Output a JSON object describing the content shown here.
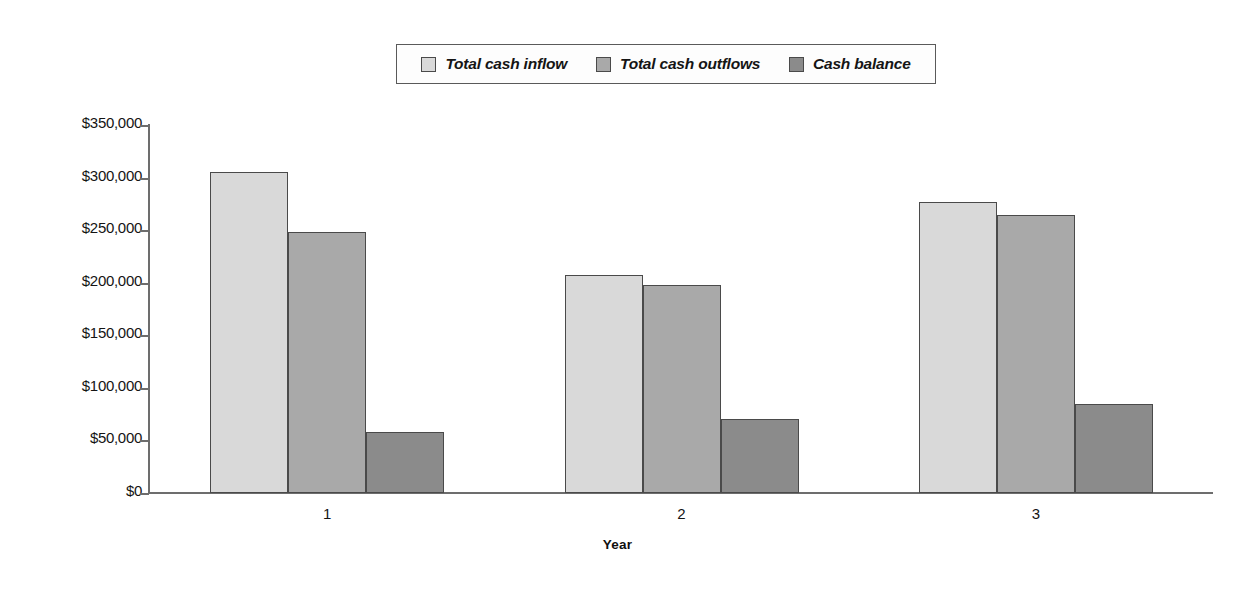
{
  "chart_data": {
    "type": "bar",
    "title": "",
    "subtitle": "",
    "xlabel": "Year",
    "ylabel": "",
    "categories": [
      "1",
      "2",
      "3"
    ],
    "series": [
      {
        "name": "Total cash inflow",
        "color": "#d9d9d9",
        "values": [
          305000,
          207000,
          277000
        ]
      },
      {
        "name": "Total cash outflows",
        "color": "#a9a9a9",
        "values": [
          248000,
          198000,
          264000
        ]
      },
      {
        "name": "Cash balance",
        "color": "#8b8b8b",
        "values": [
          58000,
          70000,
          85000
        ]
      }
    ],
    "ylim": [
      0,
      350000
    ],
    "ytick_values": [
      0,
      50000,
      100000,
      150000,
      200000,
      250000,
      300000,
      350000
    ],
    "ytick_labels": [
      "$0",
      "$50,000",
      "$100,000",
      "$150,000",
      "$200,000",
      "$250,000",
      "$300,000",
      "$350,000"
    ],
    "xtick_labels": [
      "1",
      "2",
      "3"
    ],
    "grid": false,
    "legend_position": "top-center",
    "axis_color": "#6d6d6d",
    "bar_border_color": "#4a4a4a",
    "background_color": "#ffffff"
  },
  "legend": {
    "entries": [
      {
        "label": "Total cash inflow",
        "swatch": "#d9d9d9"
      },
      {
        "label": "Total cash outflows",
        "swatch": "#a9a9a9"
      },
      {
        "label": "Cash balance",
        "swatch": "#8b8b8b"
      }
    ]
  }
}
